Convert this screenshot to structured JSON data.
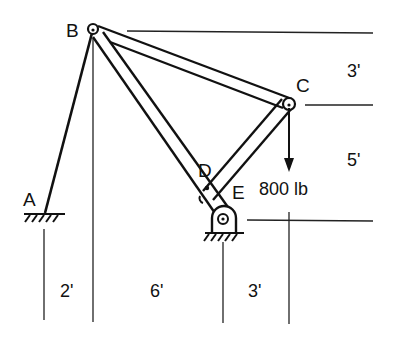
{
  "diagram": {
    "type": "truss-frame-statics",
    "points": {
      "A": {
        "label": "A",
        "x": 44,
        "y": 213
      },
      "B": {
        "label": "B",
        "x": 93,
        "y": 29
      },
      "C": {
        "label": "C",
        "x": 289,
        "y": 104
      },
      "D": {
        "label": "D",
        "x": 207,
        "y": 188
      },
      "E": {
        "label": "E",
        "x": 224,
        "y": 214
      }
    },
    "members": [
      {
        "name": "AB",
        "kind": "cable/rod"
      },
      {
        "name": "BC",
        "kind": "bar"
      },
      {
        "name": "BE",
        "kind": "bar"
      },
      {
        "name": "CD",
        "kind": "bar"
      }
    ],
    "load": {
      "label": "800 lb",
      "at": "C",
      "direction": "down"
    },
    "dimensions": {
      "vertical": [
        {
          "label": "3'",
          "between": "B-C"
        },
        {
          "label": "5'",
          "between": "C-E"
        }
      ],
      "horizontal": [
        {
          "label": "2'",
          "between": "A-B"
        },
        {
          "label": "6'",
          "between": "B-E"
        },
        {
          "label": "3'",
          "between": "E-C"
        }
      ]
    },
    "supports": [
      {
        "at": "A",
        "kind": "fixed ground"
      },
      {
        "at": "E",
        "kind": "pin support"
      }
    ],
    "colors": {
      "ink": "#111111",
      "background": "#ffffff"
    }
  }
}
